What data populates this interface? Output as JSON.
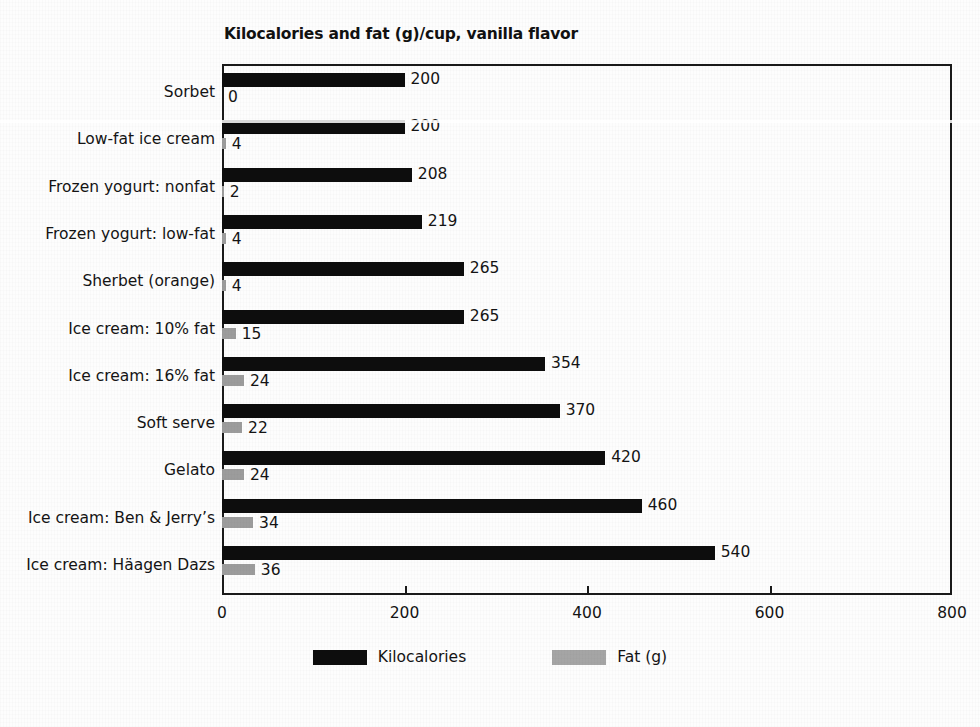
{
  "chart_data": {
    "type": "bar",
    "orientation": "horizontal",
    "title": "Kilocalories and fat (g)/cup, vanilla flavor",
    "xlabel": "",
    "ylabel": "",
    "xlim": [
      0,
      800
    ],
    "xticks": [
      0,
      200,
      400,
      600,
      800
    ],
    "grid": false,
    "legend_position": "bottom",
    "categories": [
      "Sorbet",
      "Low-fat ice cream",
      "Frozen yogurt: nonfat",
      "Frozen yogurt: low-fat",
      "Sherbet (orange)",
      "Ice cream: 10% fat",
      "Ice cream: 16% fat",
      "Soft serve",
      "Gelato",
      "Ice cream: Ben & Jerry’s",
      "Ice cream: Häagen Dazs"
    ],
    "series": [
      {
        "name": "Kilocalories",
        "color": "#0d0d0d",
        "values": [
          200,
          200,
          208,
          219,
          265,
          265,
          354,
          370,
          420,
          460,
          540
        ]
      },
      {
        "name": "Fat (g)",
        "color": "#9c9c9c",
        "values": [
          0,
          4,
          2,
          4,
          4,
          15,
          24,
          22,
          24,
          34,
          36
        ]
      }
    ]
  },
  "legend": {
    "items": [
      {
        "label": "Kilocalories"
      },
      {
        "label": "Fat (g)"
      }
    ]
  }
}
